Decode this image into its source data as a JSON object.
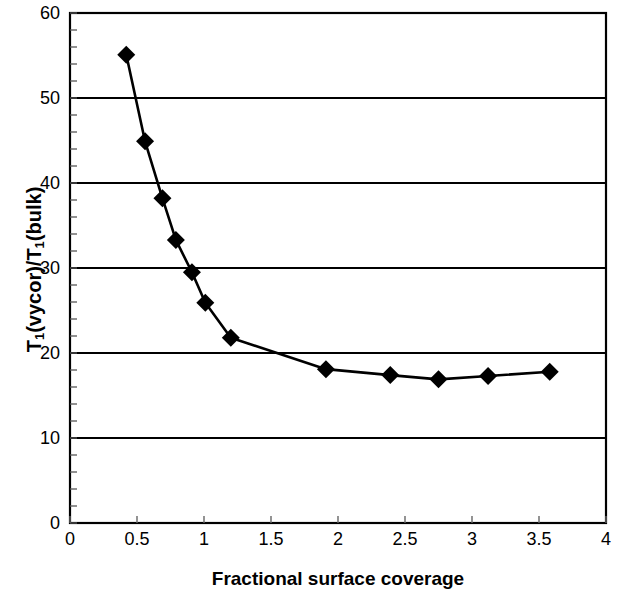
{
  "chart_data": {
    "type": "line",
    "title": "",
    "xlabel": "Fractional surface coverage",
    "ylabel": "T1(vycor)/T1(bulk)",
    "ylabel_parts": {
      "t": "T",
      "sub": "1",
      "rest1": "(vycor)/T",
      "sub2": "1",
      "rest2": "(bulk)"
    },
    "xlim": [
      0,
      4
    ],
    "ylim": [
      0,
      60
    ],
    "xticks": [
      0,
      0.5,
      1,
      1.5,
      2,
      2.5,
      3,
      3.5,
      4
    ],
    "xtick_labels": [
      "0",
      "0.5",
      "1",
      "1.5",
      "2",
      "2.5",
      "3",
      "3.5",
      "4"
    ],
    "yticks": [
      0,
      10,
      20,
      30,
      40,
      50,
      60
    ],
    "ytick_labels": [
      "0",
      "10",
      "20",
      "30",
      "40",
      "50",
      "60"
    ],
    "y_minor_tick_step": 2,
    "grid": "horizontal-major",
    "legend": "none",
    "marker": "diamond",
    "marker_color": "#000000",
    "line_color": "#000000",
    "series": [
      {
        "name": "T1 ratio vs coverage",
        "points": [
          {
            "x": 0.42,
            "y": 55.1
          },
          {
            "x": 0.56,
            "y": 44.9
          },
          {
            "x": 0.69,
            "y": 38.2
          },
          {
            "x": 0.79,
            "y": 33.3
          },
          {
            "x": 0.91,
            "y": 29.5
          },
          {
            "x": 1.01,
            "y": 25.9
          },
          {
            "x": 1.2,
            "y": 21.8
          },
          {
            "x": 1.91,
            "y": 18.1
          },
          {
            "x": 2.39,
            "y": 17.4
          },
          {
            "x": 2.75,
            "y": 16.9
          },
          {
            "x": 3.12,
            "y": 17.3
          },
          {
            "x": 3.58,
            "y": 17.8
          }
        ]
      }
    ]
  },
  "axis": {
    "x_title": "Fractional surface coverage",
    "y_title_main": "T",
    "y_title_sub": "1",
    "y_title_mid": "(vycor)/T",
    "y_title_sub2": "1",
    "y_title_end": "(bulk)"
  },
  "xticklabels": {
    "t0": "0",
    "t1": "0.5",
    "t2": "1",
    "t3": "1.5",
    "t4": "2",
    "t5": "2.5",
    "t6": "3",
    "t7": "3.5",
    "t8": "4"
  },
  "yticklabels": {
    "t0": "0",
    "t1": "10",
    "t2": "20",
    "t3": "30",
    "t4": "40",
    "t5": "50",
    "t6": "60"
  },
  "colors": {
    "background": "#ffffff",
    "axis": "#000000",
    "grid": "#000000",
    "series": "#000000"
  }
}
